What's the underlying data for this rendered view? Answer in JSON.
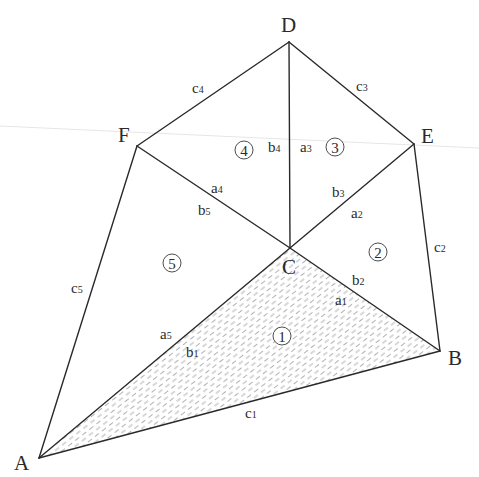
{
  "diagram": {
    "type": "geometric-figure",
    "vertices": {
      "A": {
        "label": "A",
        "x": 39,
        "y": 458
      },
      "B": {
        "label": "B",
        "x": 440,
        "y": 351
      },
      "C": {
        "label": "C",
        "x": 290,
        "y": 248
      },
      "D": {
        "label": "D",
        "x": 289,
        "y": 42
      },
      "E": {
        "label": "E",
        "x": 414,
        "y": 144
      },
      "F": {
        "label": "F",
        "x": 137,
        "y": 146
      }
    },
    "triangles": [
      {
        "id": "1",
        "label": "1",
        "vertices": [
          "A",
          "B",
          "C"
        ],
        "hatched": true
      },
      {
        "id": "2",
        "label": "2",
        "vertices": [
          "B",
          "C",
          "E"
        ],
        "hatched": false
      },
      {
        "id": "3",
        "label": "3",
        "vertices": [
          "C",
          "E",
          "D"
        ],
        "hatched": false
      },
      {
        "id": "4",
        "label": "4",
        "vertices": [
          "C",
          "D",
          "F"
        ],
        "hatched": false
      },
      {
        "id": "5",
        "label": "5",
        "vertices": [
          "C",
          "F",
          "A"
        ],
        "hatched": false
      }
    ],
    "side_labels": {
      "c1": {
        "base": "c",
        "sub": "1",
        "edge": "AB"
      },
      "c2": {
        "base": "c",
        "sub": "2",
        "edge": "BE"
      },
      "c3": {
        "base": "c",
        "sub": "3",
        "edge": "ED"
      },
      "c4": {
        "base": "c",
        "sub": "4",
        "edge": "DF"
      },
      "c5": {
        "base": "c",
        "sub": "5",
        "edge": "FA"
      },
      "a1": {
        "base": "a",
        "sub": "1",
        "edge": "CB"
      },
      "b2": {
        "base": "b",
        "sub": "2",
        "edge": "CB"
      },
      "a2": {
        "base": "a",
        "sub": "2",
        "edge": "CE"
      },
      "b3": {
        "base": "b",
        "sub": "3",
        "edge": "CE"
      },
      "a3": {
        "base": "a",
        "sub": "3",
        "edge": "CD"
      },
      "b4": {
        "base": "b",
        "sub": "4",
        "edge": "CD"
      },
      "a4": {
        "base": "a",
        "sub": "4",
        "edge": "CF"
      },
      "b5": {
        "base": "b",
        "sub": "5",
        "edge": "CF"
      },
      "a5": {
        "base": "a",
        "sub": "5",
        "edge": "CA"
      },
      "b1": {
        "base": "b",
        "sub": "1",
        "edge": "CA"
      }
    },
    "colors": {
      "stroke": "#2a2a2a",
      "hatch": "#a8a8a8",
      "background": "#ffffff"
    }
  }
}
